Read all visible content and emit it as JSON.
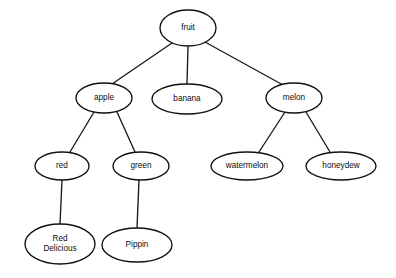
{
  "diagram": {
    "type": "tree",
    "background_color": "#ffffff",
    "node_fill_color": "#ffffff",
    "node_stroke_color": "#101010",
    "edge_color": "#1a1a1a",
    "text_color": "#0d0d0d",
    "nodes": [
      {
        "id": "fruit",
        "label": "fruit",
        "lines": [
          "fruit"
        ],
        "cx": 188,
        "cy": 28,
        "rx": 28,
        "ry": 18,
        "level": 0
      },
      {
        "id": "apple",
        "label": "apple",
        "lines": [
          "apple"
        ],
        "cx": 104,
        "cy": 98,
        "rx": 28,
        "ry": 15,
        "level": 1
      },
      {
        "id": "banana",
        "label": "banana",
        "lines": [
          "banana"
        ],
        "cx": 187,
        "cy": 99,
        "rx": 35,
        "ry": 15,
        "level": 1
      },
      {
        "id": "melon",
        "label": "melon",
        "lines": [
          "melon"
        ],
        "cx": 294,
        "cy": 98,
        "rx": 28,
        "ry": 15,
        "level": 1
      },
      {
        "id": "red",
        "label": "red",
        "lines": [
          "red"
        ],
        "cx": 62,
        "cy": 166,
        "rx": 27,
        "ry": 14,
        "level": 2
      },
      {
        "id": "green",
        "label": "green",
        "lines": [
          "green"
        ],
        "cx": 141,
        "cy": 166,
        "rx": 28,
        "ry": 14,
        "level": 2
      },
      {
        "id": "watermelon",
        "label": "watermelon",
        "lines": [
          "watermelon"
        ],
        "cx": 247,
        "cy": 166,
        "rx": 36,
        "ry": 14,
        "level": 2
      },
      {
        "id": "honeydew",
        "label": "honeydew",
        "lines": [
          "honeydew"
        ],
        "cx": 341,
        "cy": 166,
        "rx": 35,
        "ry": 14,
        "level": 2
      },
      {
        "id": "red-delicious",
        "label": "Red Delicious",
        "lines": [
          "Red",
          "Delicious"
        ],
        "cx": 60,
        "cy": 244,
        "rx": 35,
        "ry": 20,
        "level": 3
      },
      {
        "id": "pippin",
        "label": "Pippin",
        "lines": [
          "Pippin"
        ],
        "cx": 137,
        "cy": 245,
        "rx": 35,
        "ry": 17,
        "level": 3
      }
    ],
    "edges": [
      {
        "id": "fruit-apple",
        "from": "fruit",
        "to": "apple",
        "x1": 172,
        "y1": 43,
        "x2": 112,
        "y2": 84
      },
      {
        "id": "fruit-banana",
        "from": "fruit",
        "to": "banana",
        "x1": 188,
        "y1": 46,
        "x2": 187,
        "y2": 84
      },
      {
        "id": "fruit-melon",
        "from": "fruit",
        "to": "melon",
        "x1": 205,
        "y1": 42,
        "x2": 283,
        "y2": 85
      },
      {
        "id": "apple-red",
        "from": "apple",
        "to": "red",
        "x1": 94,
        "y1": 112,
        "x2": 70,
        "y2": 152
      },
      {
        "id": "apple-green",
        "from": "apple",
        "to": "green",
        "x1": 117,
        "y1": 112,
        "x2": 135,
        "y2": 152
      },
      {
        "id": "melon-watermelon",
        "from": "melon",
        "to": "watermelon",
        "x1": 285,
        "y1": 112,
        "x2": 259,
        "y2": 152
      },
      {
        "id": "melon-honeydew",
        "from": "melon",
        "to": "honeydew",
        "x1": 306,
        "y1": 112,
        "x2": 330,
        "y2": 152
      },
      {
        "id": "red-reddelicious",
        "from": "red",
        "to": "red-delicious",
        "x1": 62,
        "y1": 180,
        "x2": 60,
        "y2": 224
      },
      {
        "id": "green-pippin",
        "from": "green",
        "to": "pippin",
        "x1": 139,
        "y1": 180,
        "x2": 137,
        "y2": 228
      }
    ]
  }
}
